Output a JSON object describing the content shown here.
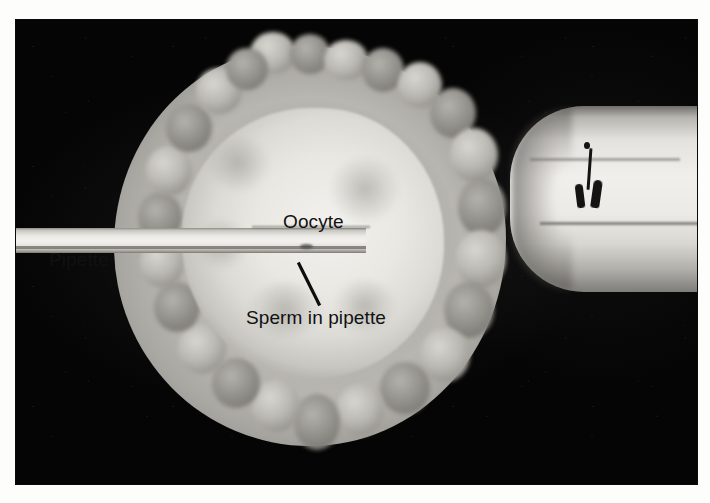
{
  "figure": {
    "kind": "photomicrograph",
    "technique": "Intracytoplasmic sperm injection (ICSI)",
    "background_color": "#fdfdfb",
    "plate_color": "#050505"
  },
  "labels": {
    "oocyte": "Oocyte",
    "sperm_in_pipette": "Sperm in pipette",
    "pipette": "Pipette"
  },
  "structures": {
    "cumulus": "cumulus-oophorus-cells",
    "zona": "zona-pellucida",
    "ooplasm": "ooplasm",
    "injection_pipette": "injection-pipette",
    "holding_pipette": "holding-pipette",
    "sperm": "sperm-cell"
  },
  "leader_lines": [
    {
      "name": "sperm-leader",
      "from": "label-sperm-in-pipette",
      "to": "injection-pipette-bore"
    }
  ],
  "colors": {
    "label_text": "#111111",
    "leader_line": "#0d0d0d",
    "cell_light": "#f2f1ed",
    "cell_mid": "#bab8b2",
    "cell_dark": "#76746f",
    "pipette_highlight": "#f3f1ee"
  }
}
